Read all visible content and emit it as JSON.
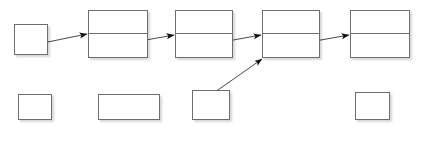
{
  "diagram": {
    "background_color": "#ffffff",
    "stroke_color": "#6e6e6e",
    "text_color": "#1a1a1a",
    "arrow_color": "#3c3c3c"
  },
  "pointers": [
    {
      "id": "head",
      "label": "head",
      "value": "",
      "x": 14,
      "y": 24,
      "w": 34,
      "h": 31,
      "caption_x": 0,
      "caption_y": 60,
      "caption_w": 62
    },
    {
      "id": "cursor",
      "label": "cursor",
      "value": "",
      "x": 192,
      "y": 90,
      "w": 38,
      "h": 30,
      "caption_x": 180,
      "caption_y": 124,
      "caption_w": 62
    }
  ],
  "variables": [
    {
      "id": "manyNodes",
      "label": "manyNodes",
      "value": "4",
      "x": 18,
      "y": 94,
      "w": 34,
      "h": 26,
      "caption_x": 0,
      "caption_y": 124,
      "caption_w": 70
    },
    {
      "id": "target",
      "label": "target",
      "value": "42",
      "x": 98,
      "y": 94,
      "w": 62,
      "h": 26,
      "caption_x": 98,
      "caption_y": 124,
      "caption_w": 62
    },
    {
      "id": "answer",
      "label": "answer",
      "value": "1",
      "x": 355,
      "y": 92,
      "w": 35,
      "h": 28,
      "caption_x": 340,
      "caption_y": 124,
      "caption_w": 66
    }
  ],
  "nodes": [
    {
      "id": "node1",
      "data": "99",
      "link": "",
      "x": 88,
      "y": 10,
      "w": 60,
      "h": 48
    },
    {
      "id": "node2",
      "data": "42",
      "link": "",
      "x": 175,
      "y": 10,
      "w": 58,
      "h": 48
    },
    {
      "id": "node3",
      "data": "8",
      "link": "",
      "x": 262,
      "y": 10,
      "w": 58,
      "h": 48
    },
    {
      "id": "node4",
      "data": "42",
      "link": "null",
      "x": 350,
      "y": 10,
      "w": 60,
      "h": 48
    }
  ],
  "arrows": [
    {
      "id": "head-to-node1",
      "x1": 28,
      "y1": 46,
      "x2": 87,
      "y2": 34
    },
    {
      "id": "node1-to-node2",
      "x1": 112,
      "y1": 46,
      "x2": 174,
      "y2": 35
    },
    {
      "id": "node2-to-node3",
      "x1": 200,
      "y1": 46,
      "x2": 261,
      "y2": 35
    },
    {
      "id": "node3-to-node4",
      "x1": 287,
      "y1": 46,
      "x2": 349,
      "y2": 35
    },
    {
      "id": "cursor-to-node3",
      "x1": 198,
      "y1": 104,
      "x2": 262,
      "y2": 59
    }
  ]
}
